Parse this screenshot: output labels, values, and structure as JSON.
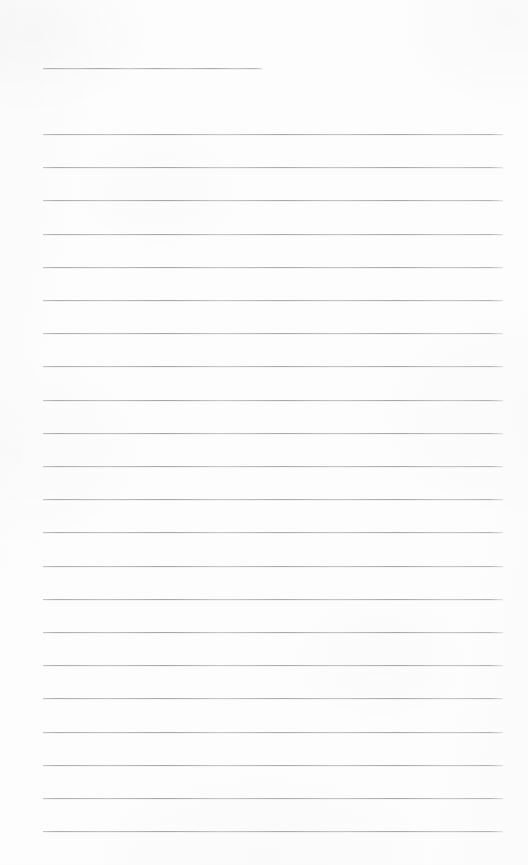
{
  "document": {
    "type": "blank-ruled-notepad-page",
    "title_text": "",
    "body_text": "",
    "orientation": "portrait",
    "page_width": 528,
    "page_height": 865,
    "background_color": "#fdfdfd",
    "rule_color": "#b5b5b9",
    "rule_thickness": 1,
    "has_written_content": false,
    "has_margin_line": false,
    "has_holes": false,
    "content_note": ""
  },
  "layout": {
    "left_margin": 43,
    "right_edge": 503,
    "top_blank_space": 68,
    "bottom_blank_space": 34,
    "line_spacing": 33.2,
    "total_rules": 24,
    "header_rule_count": 1,
    "body_rule_count": 23
  },
  "rules": [
    {
      "index": 1,
      "y": 68,
      "x_start": 43,
      "x_end": 262,
      "variant": "short",
      "role": "header-rule",
      "text": ""
    },
    {
      "index": 2,
      "y": 134,
      "x_start": 43,
      "x_end": 503,
      "variant": "full",
      "role": "body-rule",
      "text": ""
    },
    {
      "index": 3,
      "y": 167.2,
      "x_start": 43,
      "x_end": 503,
      "variant": "full",
      "role": "body-rule",
      "text": ""
    },
    {
      "index": 4,
      "y": 200.4,
      "x_start": 43,
      "x_end": 503,
      "variant": "full",
      "role": "body-rule",
      "text": ""
    },
    {
      "index": 5,
      "y": 233.6,
      "x_start": 43,
      "x_end": 503,
      "variant": "full",
      "role": "body-rule",
      "text": ""
    },
    {
      "index": 6,
      "y": 266.8,
      "x_start": 43,
      "x_end": 503,
      "variant": "full",
      "role": "body-rule",
      "text": ""
    },
    {
      "index": 7,
      "y": 300.0,
      "x_start": 43,
      "x_end": 503,
      "variant": "full",
      "role": "body-rule",
      "text": ""
    },
    {
      "index": 8,
      "y": 333.2,
      "x_start": 43,
      "x_end": 503,
      "variant": "full",
      "role": "body-rule",
      "text": ""
    },
    {
      "index": 9,
      "y": 366.4,
      "x_start": 43,
      "x_end": 503,
      "variant": "full",
      "role": "body-rule",
      "text": ""
    },
    {
      "index": 10,
      "y": 399.6,
      "x_start": 43,
      "x_end": 503,
      "variant": "full",
      "role": "body-rule",
      "text": ""
    },
    {
      "index": 11,
      "y": 432.8,
      "x_start": 43,
      "x_end": 503,
      "variant": "full",
      "role": "body-rule",
      "text": ""
    },
    {
      "index": 12,
      "y": 466.0,
      "x_start": 43,
      "x_end": 503,
      "variant": "full",
      "role": "body-rule",
      "text": ""
    },
    {
      "index": 13,
      "y": 499.2,
      "x_start": 43,
      "x_end": 503,
      "variant": "full",
      "role": "body-rule",
      "text": ""
    },
    {
      "index": 14,
      "y": 532.4,
      "x_start": 43,
      "x_end": 503,
      "variant": "full",
      "role": "body-rule",
      "text": ""
    },
    {
      "index": 15,
      "y": 565.6,
      "x_start": 43,
      "x_end": 503,
      "variant": "full",
      "role": "body-rule",
      "text": ""
    },
    {
      "index": 16,
      "y": 598.8,
      "x_start": 43,
      "x_end": 503,
      "variant": "full",
      "role": "body-rule",
      "text": ""
    },
    {
      "index": 17,
      "y": 632.0,
      "x_start": 43,
      "x_end": 503,
      "variant": "full",
      "role": "body-rule",
      "text": ""
    },
    {
      "index": 18,
      "y": 665.2,
      "x_start": 43,
      "x_end": 503,
      "variant": "full",
      "role": "body-rule",
      "text": ""
    },
    {
      "index": 19,
      "y": 698.4,
      "x_start": 43,
      "x_end": 503,
      "variant": "full",
      "role": "body-rule",
      "text": ""
    },
    {
      "index": 20,
      "y": 731.6,
      "x_start": 43,
      "x_end": 503,
      "variant": "full",
      "role": "body-rule",
      "text": ""
    },
    {
      "index": 21,
      "y": 764.8,
      "x_start": 43,
      "x_end": 503,
      "variant": "full",
      "role": "body-rule",
      "text": ""
    },
    {
      "index": 22,
      "y": 798.0,
      "x_start": 43,
      "x_end": 503,
      "variant": "full",
      "role": "body-rule",
      "text": ""
    },
    {
      "index": 23,
      "y": 831.2,
      "x_start": 43,
      "x_end": 503,
      "variant": "full",
      "role": "body-rule",
      "text": ""
    }
  ]
}
